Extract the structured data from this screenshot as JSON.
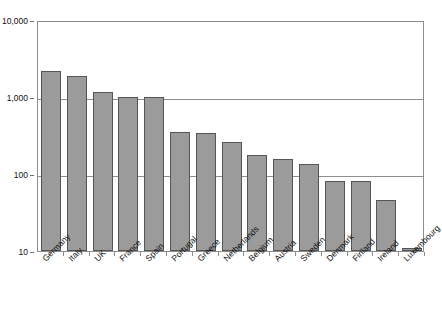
{
  "chart_data": {
    "type": "bar",
    "title": "",
    "subtitle": "",
    "xlabel": "",
    "ylabel": "",
    "yscale": "log",
    "ylim": [
      10,
      10000
    ],
    "grid": true,
    "legend": null,
    "legend_position": "none",
    "y_ticks": [
      {
        "value": 10,
        "label": "10"
      },
      {
        "value": 100,
        "label": "100"
      },
      {
        "value": 1000,
        "label": "1,000"
      },
      {
        "value": 10000,
        "label": "10,000"
      }
    ],
    "categories": [
      "Germany",
      "Italy",
      "UK",
      "France",
      "Spain",
      "Portugal",
      "Greece",
      "Netherlands",
      "Belgium",
      "Austria",
      "Sweden",
      "Denmark",
      "Finland",
      "Ireland",
      "Luxembourg"
    ],
    "values": [
      2200,
      1850,
      1150,
      1000,
      1000,
      350,
      345,
      260,
      175,
      155,
      135,
      82,
      80,
      46,
      11
    ],
    "bar_color": "#9b9b9b",
    "bar_edge_color": "#555555",
    "axis_color": "#8d8d8d"
  }
}
